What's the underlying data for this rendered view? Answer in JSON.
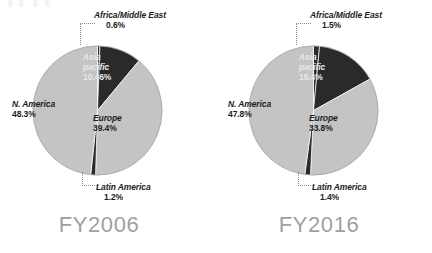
{
  "page": {
    "background_color": "#ffffff",
    "width": 432,
    "height": 253
  },
  "palette": {
    "slice_light": "#c4c4c4",
    "slice_dark": "#2a2a2a",
    "pie_outline": "#9a9a9a",
    "title_color": "#9fa0a2",
    "label_dark_text": "#1d1d1d",
    "label_light_text": "#e9e9e9",
    "leader_line": "#8d8d8d"
  },
  "charts": [
    {
      "id": "fy2006",
      "title": "FY2006",
      "labels": {
        "africa": {
          "name": "Africa/Middle East",
          "percent": "0.6%"
        },
        "asia": {
          "name": "Asia pacific",
          "percent": "10.46%"
        },
        "europe": {
          "name": "Europe",
          "percent": "39.4%"
        },
        "latin": {
          "name": "Latin America",
          "percent": "1.2%"
        },
        "namerica": {
          "name": "N. America",
          "percent": "48.3%"
        }
      }
    },
    {
      "id": "fy2016",
      "title": "FY2016",
      "labels": {
        "africa": {
          "name": "Africa/Middle East",
          "percent": "1.5%"
        },
        "asia": {
          "name": "Asia pacific",
          "percent": "15.4%"
        },
        "europe": {
          "name": "Europe",
          "percent": "33.8%"
        },
        "latin": {
          "name": "Latin America",
          "percent": "1.4%"
        },
        "namerica": {
          "name": "N. America",
          "percent": "47.8%"
        }
      }
    }
  ],
  "chart_data": [
    {
      "type": "pie",
      "title": "FY2006",
      "categories": [
        "Africa/Middle East",
        "Asia pacific",
        "Europe",
        "Latin America",
        "N. America"
      ],
      "values": [
        0.6,
        10.46,
        39.4,
        1.2,
        48.3
      ],
      "value_labels": [
        "0.6%",
        "10.46%",
        "39.4%",
        "1.2%",
        "48.3%"
      ],
      "colors": [
        "#2a2a2a",
        "#2a2a2a",
        "#c4c4c4",
        "#2a2a2a",
        "#c4c4c4"
      ],
      "start_angle_deg": 0,
      "direction": "clockwise",
      "units": "percent",
      "legend": "none",
      "labels_inside": [
        "Asia pacific",
        "Europe",
        "N. America"
      ],
      "labels_outside_with_leader": [
        "Africa/Middle East",
        "Latin America"
      ]
    },
    {
      "type": "pie",
      "title": "FY2016",
      "categories": [
        "Africa/Middle East",
        "Asia pacific",
        "Europe",
        "Latin America",
        "N. America"
      ],
      "values": [
        1.5,
        15.4,
        33.8,
        1.4,
        47.8
      ],
      "value_labels": [
        "1.5%",
        "15.4%",
        "33.8%",
        "1.4%",
        "47.8%"
      ],
      "colors": [
        "#2a2a2a",
        "#2a2a2a",
        "#c4c4c4",
        "#2a2a2a",
        "#c4c4c4"
      ],
      "start_angle_deg": 0,
      "direction": "clockwise",
      "units": "percent",
      "legend": "none",
      "labels_inside": [
        "Asia pacific",
        "Europe",
        "N. America"
      ],
      "labels_outside_with_leader": [
        "Africa/Middle East",
        "Latin America"
      ]
    }
  ]
}
